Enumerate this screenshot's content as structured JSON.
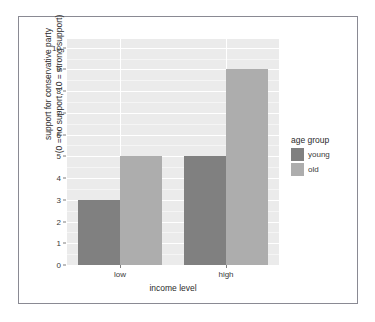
{
  "chart_data": {
    "type": "bar",
    "title": "",
    "subtitle": "",
    "xlabel": "income level",
    "ylabel_line1": "support for conservative party",
    "ylabel_line2": "(0 = no support, 10 = strong support)",
    "categories": [
      "low",
      "high"
    ],
    "series": [
      {
        "name": "young",
        "values": [
          3,
          5
        ],
        "color": "#808080"
      },
      {
        "name": "old",
        "values": [
          5,
          9
        ],
        "color": "#adadad"
      }
    ],
    "legend": {
      "title": "age group",
      "position": "right",
      "entries": [
        "young",
        "old"
      ]
    },
    "ylim": [
      0,
      10.4
    ],
    "yticks": [
      0,
      1,
      2,
      3,
      4,
      5,
      6,
      7,
      8,
      9,
      10
    ],
    "ytick_labels": [
      "0",
      "1",
      "2",
      "3",
      "4",
      "5",
      "6",
      "7",
      "8",
      "9",
      "10"
    ],
    "grid": "horizontal-major-and-minor",
    "panel_background": "#ebebeb",
    "grid_major_color": "#ffffff",
    "grid_minor_color": "#f5f5f5",
    "bar_position": "dodge",
    "frame_color": "#8a8a93"
  }
}
